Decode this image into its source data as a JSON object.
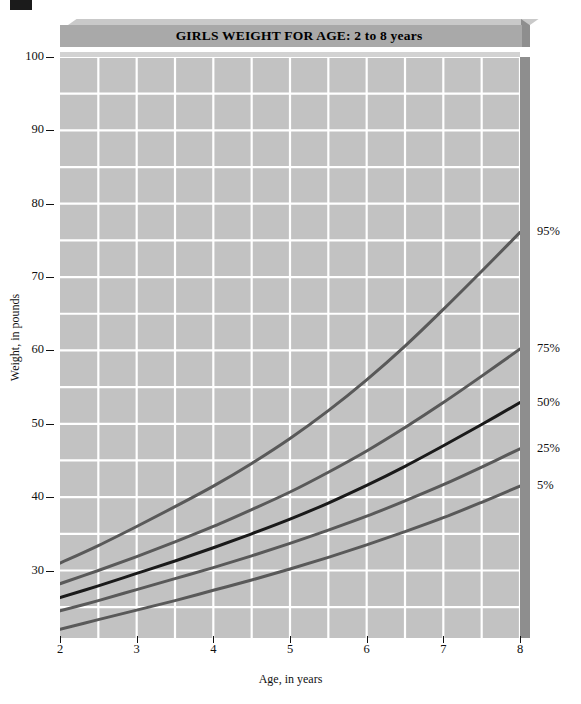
{
  "chart_data": {
    "type": "line",
    "title": "GIRLS WEIGHT FOR AGE: 2 to 8 years",
    "xlabel": "Age, in years",
    "ylabel": "Weight, in pounds",
    "xlim": [
      2,
      8
    ],
    "ylim": [
      20.8,
      100
    ],
    "grid": true,
    "grid_color": "#ffffff",
    "plot_bg": "#c2c2c2",
    "legend_position": "right-of-axis-endpoints",
    "x_ticks": [
      2,
      3,
      4,
      5,
      6,
      7,
      8
    ],
    "x_tick_labels": [
      "2",
      "3",
      "4",
      "5",
      "6",
      "7",
      "8"
    ],
    "x_gridline_step": 0.5,
    "y_ticks": [
      30,
      40,
      50,
      60,
      70,
      80,
      90,
      100
    ],
    "y_tick_labels": [
      "30",
      "40",
      "50",
      "60",
      "70",
      "80",
      "90",
      "100"
    ],
    "y_gridline_step": 5,
    "x": [
      2,
      2.5,
      3,
      3.5,
      4,
      4.5,
      5,
      5.5,
      6,
      6.5,
      7,
      7.5,
      8
    ],
    "series": [
      {
        "name": "95%",
        "label": "95%",
        "color": "#595959",
        "width": 3,
        "values": [
          31.0,
          33.4,
          36.0,
          38.7,
          41.5,
          44.6,
          48.0,
          51.8,
          56.0,
          60.6,
          65.6,
          70.8,
          76.1
        ]
      },
      {
        "name": "75%",
        "label": "75%",
        "color": "#595959",
        "width": 3,
        "values": [
          28.2,
          30.0,
          31.9,
          33.9,
          36.0,
          38.3,
          40.7,
          43.4,
          46.3,
          49.5,
          52.9,
          56.5,
          60.2
        ]
      },
      {
        "name": "50%",
        "label": "50%",
        "color": "#1a1a1a",
        "width": 3,
        "values": [
          26.3,
          27.9,
          29.6,
          31.3,
          33.1,
          35.0,
          37.0,
          39.2,
          41.6,
          44.2,
          47.0,
          49.9,
          52.9
        ]
      },
      {
        "name": "25%",
        "label": "25%",
        "color": "#595959",
        "width": 3,
        "values": [
          24.5,
          25.9,
          27.4,
          28.9,
          30.4,
          32.0,
          33.7,
          35.5,
          37.4,
          39.5,
          41.7,
          44.1,
          46.6
        ]
      },
      {
        "name": "5%",
        "label": "5%",
        "color": "#595959",
        "width": 3,
        "values": [
          22.0,
          23.3,
          24.6,
          25.9,
          27.3,
          28.7,
          30.2,
          31.8,
          33.5,
          35.3,
          37.2,
          39.3,
          41.5
        ]
      }
    ]
  }
}
